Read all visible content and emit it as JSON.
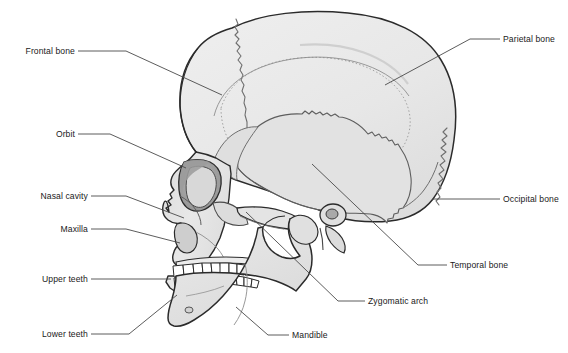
{
  "figure": {
    "view": "left lateral",
    "style": "grayscale line drawing with light gray bone fill",
    "colors": {
      "background": "#ffffff",
      "bone_fill": "#e6e6e6",
      "bone_fill_light": "#ededed",
      "bone_shadow": "#c9c9c9",
      "outline": "#2b2b2b",
      "suture": "#6e6e6e",
      "tooth_fill": "#ffffff",
      "leader_line": "#4a4a4a",
      "label_text": "#1a1a1a"
    }
  },
  "labels": [
    {
      "id": "frontal-bone",
      "text": "Frontal bone",
      "side": "left",
      "text_x": 75,
      "text_y": 51,
      "leader": "M78,51 L126,51 L222,95"
    },
    {
      "id": "orbit",
      "text": "Orbit",
      "side": "left",
      "text_x": 75,
      "text_y": 134,
      "leader": "M78,134 L110,134 L186,168"
    },
    {
      "id": "nasal-cavity",
      "text": "Nasal cavity",
      "side": "left",
      "text_x": 88,
      "text_y": 196,
      "leader": "M91,196 L126,196 L184,218"
    },
    {
      "id": "maxilla",
      "text": "Maxilla",
      "side": "left",
      "text_x": 88,
      "text_y": 229,
      "leader": "M91,229 L126,229 L180,243"
    },
    {
      "id": "upper-teeth",
      "text": "Upper teeth",
      "side": "left",
      "text_x": 88,
      "text_y": 279,
      "leader": "M91,279 L171,279"
    },
    {
      "id": "lower-teeth",
      "text": "Lower teeth",
      "side": "left",
      "text_x": 88,
      "text_y": 334,
      "leader": "M91,334 L129,334 L177,295"
    },
    {
      "id": "parietal-bone",
      "text": "Parietal bone",
      "side": "right",
      "text_x": 503,
      "text_y": 39,
      "leader": "M500,39 L470,39 L385,85"
    },
    {
      "id": "occipital-bone",
      "text": "Occipital bone",
      "side": "right",
      "text_x": 503,
      "text_y": 199,
      "leader": "M500,199 L432,199"
    },
    {
      "id": "temporal-bone",
      "text": "Temporal bone",
      "side": "right",
      "text_x": 450,
      "text_y": 265,
      "leader": "M447,265 L418,265 L312,164"
    },
    {
      "id": "zygomatic-arch",
      "text": "Zygomatic arch",
      "side": "right",
      "text_x": 368,
      "text_y": 301,
      "leader": "M365,301 L338,301 L246,212"
    },
    {
      "id": "mandible",
      "text": "Mandible",
      "side": "right",
      "text_x": 292,
      "text_y": 335,
      "leader": "M289,335 L268,335 L236,307"
    }
  ]
}
